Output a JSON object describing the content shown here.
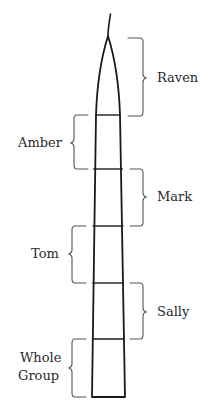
{
  "diagram": {
    "title": "",
    "stroke_color": "#1a1a1a",
    "brace_color": "#555555",
    "text_color": "#2a2a2a",
    "segments": [
      {
        "label": "Raven",
        "side": "right",
        "top": 38,
        "bottom": 116
      },
      {
        "label": "Amber",
        "side": "left",
        "top": 115,
        "bottom": 169
      },
      {
        "label": "Mark",
        "side": "right",
        "top": 169,
        "bottom": 226
      },
      {
        "label": "Tom",
        "side": "left",
        "top": 226,
        "bottom": 283
      },
      {
        "label": "Sally",
        "side": "right",
        "top": 283,
        "bottom": 339
      },
      {
        "label": "Whole Group",
        "side": "left",
        "top": 339,
        "bottom": 397
      }
    ],
    "labels": {
      "raven": "Raven",
      "amber": "Amber",
      "mark": "Mark",
      "tom": "Tom",
      "sally": "Sally",
      "whole_group_line1": "Whole",
      "whole_group_line2": "Group"
    }
  }
}
